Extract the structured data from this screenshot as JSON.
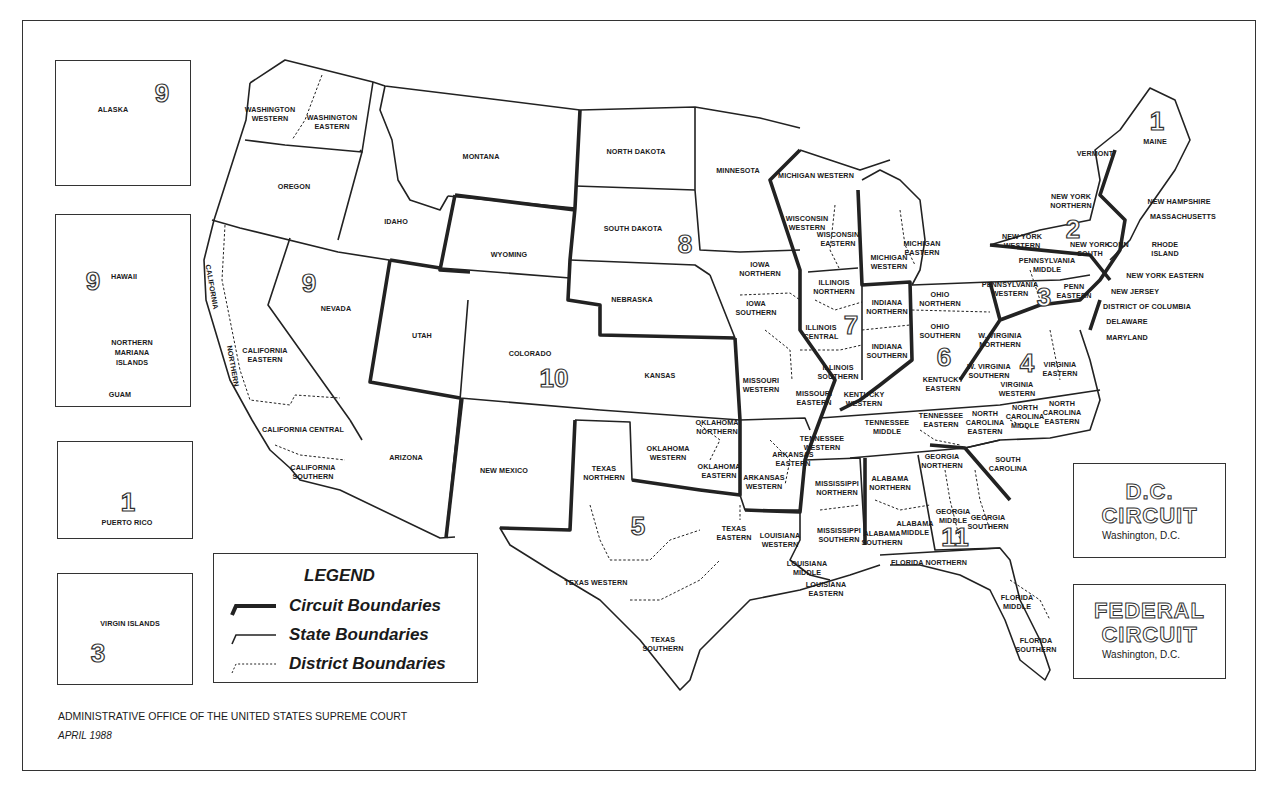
{
  "map": {
    "title": "United States Courts of Appeals and District Courts",
    "footer": {
      "publisher": "ADMINISTRATIVE OFFICE OF THE UNITED STATES SUPREME COURT",
      "date": "APRIL 1988"
    },
    "legend": {
      "title": "LEGEND",
      "items": [
        {
          "symbol": "thick-solid-line",
          "label": "Circuit Boundaries"
        },
        {
          "symbol": "thin-solid-line",
          "label": "State Boundaries"
        },
        {
          "symbol": "dotted-line",
          "label": "District Boundaries"
        }
      ]
    },
    "special_circuits": [
      {
        "name_line1": "D.C.",
        "name_line2": "CIRCUIT",
        "location": "Washington, D.C."
      },
      {
        "name_line1": "FEDERAL",
        "name_line2": "CIRCUIT",
        "location": "Washington, D.C."
      }
    ],
    "insets": {
      "alaska": {
        "label": "ALASKA",
        "circuit": "9"
      },
      "pacific": {
        "hawaii": "HAWAII",
        "circuit": "9",
        "nmi_1": "NORTHERN",
        "nmi_2": "MARIANA",
        "nmi_3": "ISLANDS",
        "guam": "GUAM"
      },
      "puerto_rico": {
        "label": "PUERTO RICO",
        "circuit": "1"
      },
      "virgin_islands": {
        "label": "VIRGIN ISLANDS",
        "circuit": "3"
      }
    },
    "circuit_numbers": [
      {
        "n": "1",
        "x": 1157,
        "y": 121
      },
      {
        "n": "2",
        "x": 1073,
        "y": 229
      },
      {
        "n": "3",
        "x": 1044,
        "y": 297
      },
      {
        "n": "4",
        "x": 1027,
        "y": 363
      },
      {
        "n": "5",
        "x": 638,
        "y": 526
      },
      {
        "n": "6",
        "x": 944,
        "y": 357
      },
      {
        "n": "7",
        "x": 851,
        "y": 325
      },
      {
        "n": "8",
        "x": 685,
        "y": 244
      },
      {
        "n": "9",
        "x": 309,
        "y": 283
      },
      {
        "n": "10",
        "x": 554,
        "y": 378
      },
      {
        "n": "11",
        "x": 955,
        "y": 537
      }
    ],
    "labels": [
      {
        "t": "WASHINGTON\nWESTERN",
        "x": 270,
        "y": 114
      },
      {
        "t": "WASHINGTON\nEASTERN",
        "x": 332,
        "y": 122
      },
      {
        "t": "OREGON",
        "x": 294,
        "y": 186
      },
      {
        "t": "IDAHO",
        "x": 396,
        "y": 221
      },
      {
        "t": "MONTANA",
        "x": 481,
        "y": 156
      },
      {
        "t": "WYOMING",
        "x": 509,
        "y": 254
      },
      {
        "t": "NEVADA",
        "x": 336,
        "y": 308
      },
      {
        "t": "CALIFORNIA",
        "x": 212,
        "y": 287,
        "r": 80
      },
      {
        "t": "NORTHERN",
        "x": 233,
        "y": 366,
        "r": 80
      },
      {
        "t": "CALIFORNIA\nEASTERN",
        "x": 265,
        "y": 355
      },
      {
        "t": "CALIFORNIA CENTRAL",
        "x": 303,
        "y": 429
      },
      {
        "t": "CALIFORNIA\nSOUTHERN",
        "x": 313,
        "y": 472
      },
      {
        "t": "UTAH",
        "x": 422,
        "y": 335
      },
      {
        "t": "COLORADO",
        "x": 530,
        "y": 353
      },
      {
        "t": "ARIZONA",
        "x": 406,
        "y": 457
      },
      {
        "t": "NEW MEXICO",
        "x": 504,
        "y": 470
      },
      {
        "t": "NORTH DAKOTA",
        "x": 636,
        "y": 151
      },
      {
        "t": "SOUTH DAKOTA",
        "x": 633,
        "y": 228
      },
      {
        "t": "NEBRASKA",
        "x": 632,
        "y": 299
      },
      {
        "t": "KANSAS",
        "x": 660,
        "y": 375
      },
      {
        "t": "MINNESOTA",
        "x": 738,
        "y": 170
      },
      {
        "t": "IOWA\nNORTHERN",
        "x": 760,
        "y": 269
      },
      {
        "t": "IOWA\nSOUTHERN",
        "x": 756,
        "y": 308
      },
      {
        "t": "MISSOURI\nWESTERN",
        "x": 761,
        "y": 385
      },
      {
        "t": "MISSOURI\nEASTERN",
        "x": 814,
        "y": 398
      },
      {
        "t": "WISCONSIN\nWESTERN",
        "x": 807,
        "y": 223
      },
      {
        "t": "WISCONSIN\nEASTERN",
        "x": 838,
        "y": 239
      },
      {
        "t": "MICHIGAN WESTERN",
        "x": 816,
        "y": 175
      },
      {
        "t": "MICHIGAN\nWESTERN",
        "x": 889,
        "y": 262
      },
      {
        "t": "MICHIGAN\nEASTERN",
        "x": 922,
        "y": 248
      },
      {
        "t": "ILLINOIS\nNORTHERN",
        "x": 834,
        "y": 287
      },
      {
        "t": "ILLINOIS\nCENTRAL",
        "x": 821,
        "y": 332
      },
      {
        "t": "ILLINOIS\nSOUTHERN",
        "x": 838,
        "y": 372
      },
      {
        "t": "INDIANA\nNORTHERN",
        "x": 887,
        "y": 307
      },
      {
        "t": "INDIANA\nSOUTHERN",
        "x": 887,
        "y": 351
      },
      {
        "t": "OHIO\nNORTHERN",
        "x": 940,
        "y": 299
      },
      {
        "t": "OHIO\nSOUTHERN",
        "x": 940,
        "y": 331
      },
      {
        "t": "KENTUCKY\nWESTERN",
        "x": 864,
        "y": 399
      },
      {
        "t": "KENTUCKY\nEASTERN",
        "x": 943,
        "y": 384
      },
      {
        "t": "TENNESSEE\nWESTERN",
        "x": 822,
        "y": 443
      },
      {
        "t": "TENNESSEE\nMIDDLE",
        "x": 887,
        "y": 427
      },
      {
        "t": "TENNESSEE\nEASTERN",
        "x": 941,
        "y": 420
      },
      {
        "t": "OKLAHOMA\nNORTHERN",
        "x": 717,
        "y": 427
      },
      {
        "t": "OKLAHOMA\nWESTERN",
        "x": 668,
        "y": 453
      },
      {
        "t": "OKLAHOMA\nEASTERN",
        "x": 719,
        "y": 471
      },
      {
        "t": "ARKANSAS\nEASTERN",
        "x": 793,
        "y": 459
      },
      {
        "t": "ARKANSAS\nWESTERN",
        "x": 764,
        "y": 482
      },
      {
        "t": "TEXAS\nNORTHERN",
        "x": 604,
        "y": 473
      },
      {
        "t": "TEXAS\nEASTERN",
        "x": 734,
        "y": 533
      },
      {
        "t": "TEXAS WESTERN",
        "x": 596,
        "y": 582
      },
      {
        "t": "TEXAS\nSOUTHERN",
        "x": 663,
        "y": 644
      },
      {
        "t": "LOUISIANA\nWESTERN",
        "x": 780,
        "y": 540
      },
      {
        "t": "LOUISIANA\nMIDDLE",
        "x": 807,
        "y": 568
      },
      {
        "t": "LOUISIANA\nEASTERN",
        "x": 826,
        "y": 589
      },
      {
        "t": "MISSISSIPPI\nNORTHERN",
        "x": 837,
        "y": 488
      },
      {
        "t": "MISSISSIPPI\nSOUTHERN",
        "x": 839,
        "y": 535
      },
      {
        "t": "ALABAMA\nNORTHERN",
        "x": 890,
        "y": 483
      },
      {
        "t": "ALABAMA\nMIDDLE",
        "x": 915,
        "y": 528
      },
      {
        "t": "ALABAMA\nSOUTHERN",
        "x": 882,
        "y": 538
      },
      {
        "t": "GEORGIA\nNORTHERN",
        "x": 942,
        "y": 461
      },
      {
        "t": "GEORGIA\nMIDDLE",
        "x": 953,
        "y": 516
      },
      {
        "t": "GEORGIA\nSOUTHERN",
        "x": 988,
        "y": 522
      },
      {
        "t": "FLORIDA NORTHERN",
        "x": 929,
        "y": 562
      },
      {
        "t": "FLORIDA\nMIDDLE",
        "x": 1017,
        "y": 602
      },
      {
        "t": "FLORIDA\nSOUTHERN",
        "x": 1036,
        "y": 645
      },
      {
        "t": "SOUTH\nCAROLINA",
        "x": 1008,
        "y": 464
      },
      {
        "t": "NORTH\nCAROLINA\nEASTERN",
        "x": 985,
        "y": 422
      },
      {
        "t": "NORTH\nCAROLINA\nMIDDLE",
        "x": 1025,
        "y": 416
      },
      {
        "t": "NORTH\nCAROLINA\nEASTERN",
        "x": 1062,
        "y": 412
      },
      {
        "t": "VIRGINIA\nEASTERN",
        "x": 1060,
        "y": 369
      },
      {
        "t": "VIRGINIA\nWESTERN",
        "x": 1017,
        "y": 389
      },
      {
        "t": "W. VIRGINIA\nNORTHERN",
        "x": 1000,
        "y": 340
      },
      {
        "t": "W. VIRGINIA\nSOUTHERN",
        "x": 989,
        "y": 371
      },
      {
        "t": "PENNSYLVANIA\nWESTERN",
        "x": 1010,
        "y": 289
      },
      {
        "t": "PENNSYLVANIA\nMIDDLE",
        "x": 1047,
        "y": 265
      },
      {
        "t": "PENN\nEASTERN",
        "x": 1074,
        "y": 291
      },
      {
        "t": "NEW YORK\nWESTERN",
        "x": 1022,
        "y": 241
      },
      {
        "t": "NEW YORK\nNORTHERN",
        "x": 1071,
        "y": 201
      },
      {
        "t": "NEW YORK\nSOUTH",
        "x": 1090,
        "y": 249
      },
      {
        "t": "CONN",
        "x": 1118,
        "y": 244
      },
      {
        "t": "VERMONT",
        "x": 1095,
        "y": 153
      },
      {
        "t": "MAINE",
        "x": 1155,
        "y": 141
      },
      {
        "t": "NEW HAMPSHIRE",
        "x": 1179,
        "y": 201
      },
      {
        "t": "MASSACHUSETTS",
        "x": 1183,
        "y": 216
      },
      {
        "t": "RHODE\nISLAND",
        "x": 1165,
        "y": 249
      },
      {
        "t": "NEW YORK EASTERN",
        "x": 1165,
        "y": 275
      },
      {
        "t": "NEW JERSEY",
        "x": 1135,
        "y": 291
      },
      {
        "t": "DISTRICT OF COLUMBIA",
        "x": 1147,
        "y": 306
      },
      {
        "t": "DELAWARE",
        "x": 1127,
        "y": 321
      },
      {
        "t": "MARYLAND",
        "x": 1127,
        "y": 337
      }
    ]
  }
}
